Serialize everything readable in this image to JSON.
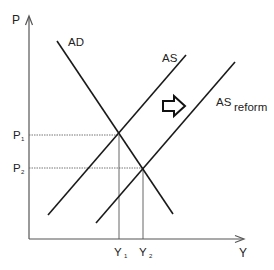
{
  "diagram": {
    "type": "AD-AS supply shift",
    "axes": {
      "y_label": "P",
      "x_label": "Y"
    },
    "curves": {
      "ad": {
        "label": "AD"
      },
      "as": {
        "label": "AS"
      },
      "as_reform": {
        "label": "AS",
        "subscript": "reform"
      }
    },
    "levels": {
      "p1": {
        "label": "P",
        "subscript": "1"
      },
      "p2": {
        "label": "P",
        "subscript": "2"
      },
      "y1": {
        "label": "Y",
        "subscript": "1"
      },
      "y2": {
        "label": "Y",
        "subscript": "2"
      }
    },
    "shift_arrow": {
      "icon": "right-outline-arrow-icon",
      "direction": "right"
    },
    "colors": {
      "line": "#1a1a1a",
      "axis": "#555555",
      "guide": "#666666"
    }
  }
}
